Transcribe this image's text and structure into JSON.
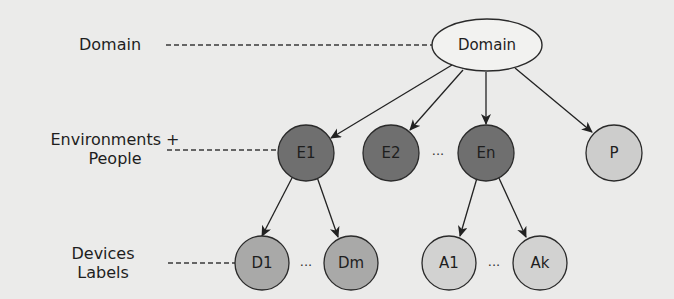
{
  "diagram": {
    "type": "hierarchy-tree",
    "level_labels": [
      {
        "id": "domain",
        "line1": "Domain",
        "line2": ""
      },
      {
        "id": "environments",
        "line1": "Environments +",
        "line2": "People"
      },
      {
        "id": "devices",
        "line1": "Devices",
        "line2": "Labels"
      }
    ],
    "root": {
      "label": "Domain",
      "shape": "ellipse",
      "fill": "#f2f2f0"
    },
    "level2": [
      {
        "label": "E1",
        "fill": "#6f6f6f"
      },
      {
        "label": "E2",
        "fill": "#6f6f6f"
      },
      {
        "label": "En",
        "fill": "#6f6f6f"
      },
      {
        "label": "P",
        "fill": "#cdcdcc"
      }
    ],
    "level3": [
      {
        "label": "D1",
        "parent": "E1",
        "fill": "#a9a9a8"
      },
      {
        "label": "Dm",
        "parent": "E1",
        "fill": "#a9a9a8"
      },
      {
        "label": "A1",
        "parent": "En",
        "fill": "#d2d2d1"
      },
      {
        "label": "Ak",
        "parent": "En",
        "fill": "#d2d2d1"
      }
    ],
    "ellipsis": "...",
    "edges": [
      [
        "Domain",
        "E1"
      ],
      [
        "Domain",
        "E2"
      ],
      [
        "Domain",
        "En"
      ],
      [
        "Domain",
        "P"
      ],
      [
        "E1",
        "D1"
      ],
      [
        "E1",
        "Dm"
      ],
      [
        "En",
        "A1"
      ],
      [
        "En",
        "Ak"
      ]
    ],
    "colors": {
      "background": "#ebebea",
      "stroke": "#2a2a2a",
      "dashed_line": "#3a3a3a"
    }
  }
}
